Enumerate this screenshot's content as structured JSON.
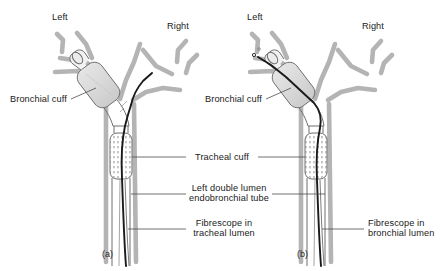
{
  "figure": {
    "type": "medical-illustration",
    "background_color": "#ffffff",
    "airway_color": "#b3b3b3",
    "tube_outline_color": "#6e6e6e",
    "cuff_fill_color": "#dcdcdc",
    "fibrescope_color": "#1a1a1a",
    "leader_line_color": "#4d4d4d",
    "text_color": "#1a1a1a"
  },
  "panels": [
    {
      "id": "a",
      "tag": "(a)",
      "orientation_labels": {
        "left": "Left",
        "right": "Right"
      },
      "callouts": {
        "bronchial_cuff": "Bronchial cuff"
      },
      "fibrescope_position": "tracheal lumen"
    },
    {
      "id": "b",
      "tag": "(b)",
      "orientation_labels": {
        "left": "Left",
        "right": "Right"
      },
      "callouts": {
        "bronchial_cuff": "Bronchial cuff"
      },
      "fibrescope_position": "bronchial lumen"
    }
  ],
  "center_labels": {
    "tracheal_cuff": "Tracheal cuff",
    "tube_line1": "Left double lumen",
    "tube_line2": "endobronchial tube",
    "fibrescope_a_line1": "Fibrescope in",
    "fibrescope_a_line2": "tracheal lumen",
    "fibrescope_b_line1": "Fibrescope in",
    "fibrescope_b_line2": "bronchial lumen"
  }
}
